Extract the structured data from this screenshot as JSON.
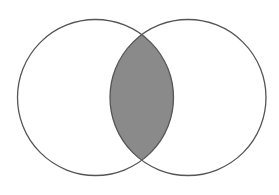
{
  "diagram": {
    "type": "venn",
    "sets": [
      {
        "id": "left",
        "cx": 95.5,
        "cy": 97.5,
        "r": 78
      },
      {
        "id": "right",
        "cx": 188,
        "cy": 97.5,
        "r": 78
      }
    ],
    "shaded_region": "intersection",
    "colors": {
      "stroke": "#555555",
      "intersection_fill": "#8a8a8a",
      "background": "#ffffff"
    }
  }
}
